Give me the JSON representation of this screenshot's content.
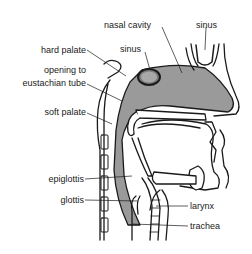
{
  "diagram": {
    "colors": {
      "line": "#1a1a1a",
      "airway_fill": "#9a9a9a",
      "background": "#ffffff"
    },
    "labels": {
      "nasal_cavity": "nasal cavity",
      "sinus_top": "sinus",
      "sinus_mid": "sinus",
      "hard_palate": "hard palate",
      "opening_line1": "opening to",
      "opening_line2": "eustachian tube",
      "soft_palate": "soft palate",
      "epiglottis": "epiglottis",
      "glottis": "glottis",
      "larynx": "larynx",
      "trachea": "trachea"
    }
  }
}
